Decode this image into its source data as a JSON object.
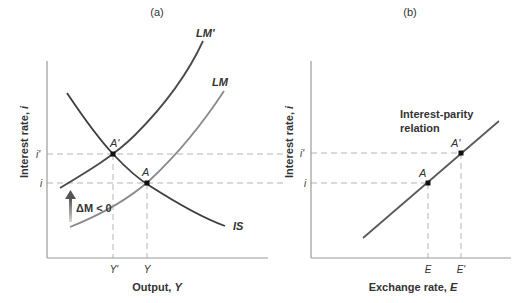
{
  "panels": {
    "a": {
      "title": "(a)",
      "x_axis_label_prefix": "Output, ",
      "x_axis_label_var": "Y",
      "y_axis_label_prefix": "Interest rate, ",
      "y_axis_label_var": "i",
      "x_ticks": [
        "Y'",
        "Y"
      ],
      "y_ticks": [
        "i'",
        "i"
      ],
      "curves": {
        "is": "IS",
        "lm": "LM",
        "lm_prime": "LM'"
      },
      "points": {
        "a": "A",
        "a_prime": "A'"
      },
      "shift_annotation": "ΔM < 0"
    },
    "b": {
      "title": "(b)",
      "x_axis_label_prefix": "Exchange rate, ",
      "x_axis_label_var": "E",
      "y_axis_label_prefix": "Interest rate, ",
      "y_axis_label_var": "i",
      "x_ticks": [
        "E",
        "E'"
      ],
      "y_ticks": [
        "i'",
        "i"
      ],
      "curve_label_line1": "Interest-parity",
      "curve_label_line2": "relation",
      "points": {
        "a": "A",
        "a_prime": "A'"
      }
    }
  },
  "colors": {
    "axis": "#9a9a9a",
    "lm_prime": "#4a4a4a",
    "lm": "#8a8a8a",
    "is": "#3d3d3d",
    "parity": "#5a5a5a",
    "dashed": "#b5b5b5",
    "point": "#111111",
    "text": "#333333"
  }
}
